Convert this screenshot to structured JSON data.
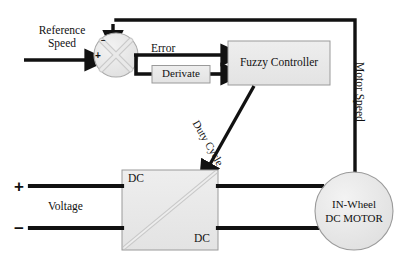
{
  "figure": {
    "type": "block-diagram",
    "title_shown": false,
    "background": "#ffffff",
    "line_color": "#111111",
    "block_fill": "#ebebeb",
    "block_stroke": "#9a9a9a"
  },
  "labels": {
    "reference_speed": "Reference\nSpeed",
    "error": "Error",
    "derivate": "Derivate",
    "fuzzy_controller": "Fuzzy Controller",
    "duty_cycle": "Duty Cycle",
    "motor_speed": "Motor Speed",
    "voltage": "Voltage",
    "plus_sign": "+",
    "minus_sign": "−",
    "junction_plus": "+",
    "junction_minus": "−",
    "chopper_top": "DC",
    "chopper_bottom": "DC",
    "motor_line1": "IN-Wheel",
    "motor_line2": "DC MOTOR"
  },
  "blocks": [
    {
      "name": "summing-junction",
      "shape": "circle",
      "label": "",
      "x": 94,
      "y": 33,
      "w": 44,
      "h": 44
    },
    {
      "name": "derivate-block",
      "shape": "rect",
      "label": "Derivate",
      "x": 152,
      "y": 65,
      "w": 58,
      "h": 18
    },
    {
      "name": "fuzzy-controller-block",
      "shape": "rect",
      "label": "Fuzzy Controller",
      "x": 228,
      "y": 41,
      "w": 102,
      "h": 44
    },
    {
      "name": "dc-dc-chopper-block",
      "shape": "rect",
      "label": "DC / DC",
      "x": 122,
      "y": 170,
      "w": 96,
      "h": 80
    },
    {
      "name": "in-wheel-dc-motor",
      "shape": "circle",
      "label": "IN-Wheel DC MOTOR",
      "x": 315,
      "y": 172,
      "w": 78,
      "h": 78
    }
  ],
  "connections": [
    {
      "name": "reference-speed-input",
      "from": "input",
      "to": "summing-junction",
      "label": "Reference Speed"
    },
    {
      "name": "feedback-to-junction",
      "from": "in-wheel-dc-motor",
      "to": "summing-junction",
      "label": "Motor Speed"
    },
    {
      "name": "error-to-fuzzy",
      "from": "summing-junction",
      "to": "fuzzy-controller-block",
      "label": "Error"
    },
    {
      "name": "error-to-derivate",
      "from": "summing-junction",
      "to": "derivate-block",
      "label": ""
    },
    {
      "name": "derivate-to-fuzzy",
      "from": "derivate-block",
      "to": "fuzzy-controller-block",
      "label": ""
    },
    {
      "name": "duty-cycle-to-chopper",
      "from": "fuzzy-controller-block",
      "to": "dc-dc-chopper-block",
      "label": "Duty Cycle"
    },
    {
      "name": "voltage-positive-line",
      "from": "supply-plus",
      "to": "dc-dc-chopper-block",
      "label": "+"
    },
    {
      "name": "voltage-negative-line",
      "from": "supply-minus",
      "to": "dc-dc-chopper-block",
      "label": "−"
    },
    {
      "name": "chopper-to-motor-top",
      "from": "dc-dc-chopper-block",
      "to": "in-wheel-dc-motor",
      "label": ""
    },
    {
      "name": "chopper-to-motor-bottom",
      "from": "dc-dc-chopper-block",
      "to": "in-wheel-dc-motor",
      "label": ""
    }
  ]
}
